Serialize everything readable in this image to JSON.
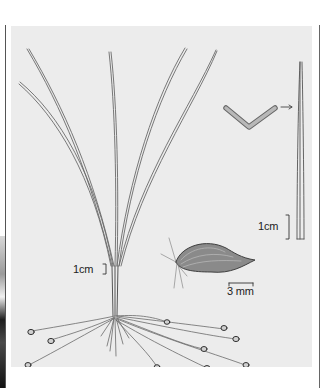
{
  "illustration": {
    "subject": "grass-like plant with leaf cross-section, seed and root tubers",
    "scale_labels": {
      "leaf_tip": "1cm",
      "whole_plant": "1cm",
      "seed": "3 mm"
    },
    "colors": {
      "plate_background": "#ececec",
      "page_background": "#ffffff",
      "line_art": "#555555",
      "rule": "#555555"
    }
  }
}
